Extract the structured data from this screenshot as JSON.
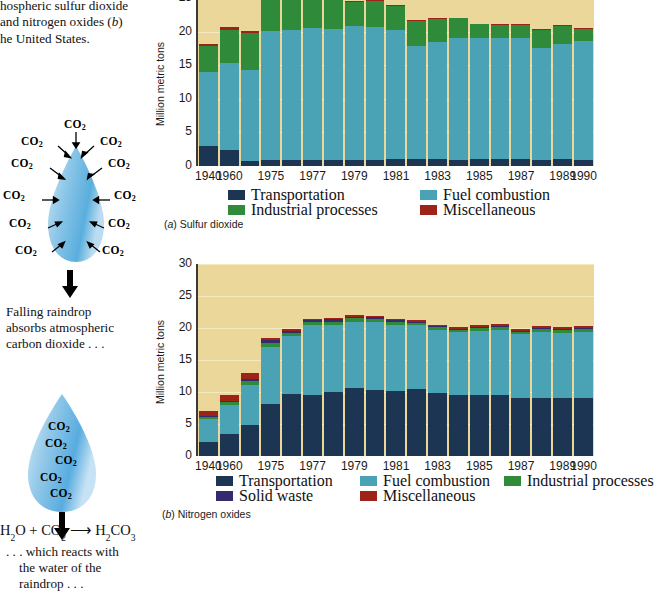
{
  "caption": {
    "line1": "hospheric sulfur dioxide",
    "line2_a": "and nitrogen oxides (",
    "line2_b": "b",
    "line2_c": ")",
    "line3": "he United States."
  },
  "diagram": {
    "co2_label": "CO",
    "co2_sub": "2",
    "note1_line1": "Falling raindrop",
    "note1_line2": "absorbs atmospheric",
    "note1_line3": "carbon dioxide . . .",
    "note2_line1": ". . . which reacts with",
    "note2_line2": "the water of the",
    "note2_line3": "raindrop . . .",
    "equation": "H2O + CO2  →  H2CO3",
    "arrow_icon": "down-arrow-icon",
    "drop_icon": "raindrop-icon"
  },
  "colors": {
    "plot_background": "#ecd79a",
    "transportation": "#1b3553",
    "fuel_combustion": "#4aa3b5",
    "industrial_processes": "#2f8b39",
    "solid_waste": "#352a6e",
    "miscellaneous": "#9d2319",
    "gridline": "#f6ecc8",
    "axis": "#3a3a3a"
  },
  "chart_data": [
    {
      "id": "a",
      "type": "bar",
      "stacked": true,
      "title": "",
      "figure_note_prefix": "(",
      "figure_note_letter": "a",
      "figure_note_suffix": ") Sulfur dioxide",
      "xlabel": "",
      "ylabel": "Million metric tons",
      "ylim": [
        0,
        25
      ],
      "yticks": [
        0,
        5,
        10,
        15,
        20,
        25
      ],
      "ytick_labels": [
        "0",
        "5",
        "10",
        "15",
        "20",
        "25"
      ],
      "grid": true,
      "legend_position": "below",
      "categories": [
        1940,
        1960,
        1974,
        1975,
        1976,
        1977,
        1978,
        1979,
        1980,
        1981,
        1982,
        1983,
        1984,
        1985,
        1986,
        1987,
        1988,
        1989,
        1990
      ],
      "tick_labels": [
        "1940",
        "1960",
        "",
        "1975",
        "",
        "1977",
        "",
        "1979",
        "",
        "1981",
        "",
        "1983",
        "",
        "1985",
        "",
        "1987",
        "",
        "1989",
        "1990"
      ],
      "series": [
        {
          "name": "Transportation",
          "color": "#1b3553",
          "values": [
            3.0,
            2.4,
            0.8,
            0.9,
            0.9,
            0.9,
            0.9,
            0.9,
            0.9,
            1.1,
            1.1,
            1.0,
            0.9,
            1.1,
            1.1,
            1.1,
            0.9,
            1.0,
            0.9
          ]
        },
        {
          "name": "Fuel combustion",
          "color": "#4aa3b5",
          "values": [
            11.0,
            13.0,
            13.5,
            21.0,
            20.1,
            20.7,
            21.4,
            19.9,
            19.8,
            19.2,
            16.8,
            17.5,
            18.1,
            17.9,
            17.9,
            17.9,
            16.6,
            17.1,
            17.7
          ]
        },
        {
          "name": "Industrial processes",
          "color": "#2f8b39",
          "values": [
            3.8,
            4.9,
            5.5,
            5.2,
            4.8,
            4.5,
            5.0,
            3.6,
            3.9,
            3.5,
            3.7,
            3.4,
            3.0,
            2.1,
            2.0,
            2.0,
            2.8,
            2.8,
            1.8
          ]
        },
        {
          "name": "Miscellaneous",
          "color": "#9d2319",
          "values": [
            0.4,
            0.4,
            0.3,
            0.1,
            0.1,
            0.1,
            0.1,
            0.1,
            0.1,
            0.1,
            0.1,
            0.1,
            0.1,
            0.1,
            0.1,
            0.1,
            0.1,
            0.1,
            0.1
          ]
        }
      ],
      "legend": [
        {
          "label": "Transportation",
          "color": "#1b3553"
        },
        {
          "label": "Fuel combustion",
          "color": "#4aa3b5"
        },
        {
          "label": "Industrial processes",
          "color": "#2f8b39"
        },
        {
          "label": "Miscellaneous",
          "color": "#9d2319"
        }
      ]
    },
    {
      "id": "b",
      "type": "bar",
      "stacked": true,
      "title": "",
      "figure_note_prefix": "(",
      "figure_note_letter": "b",
      "figure_note_suffix": ") Nitrogen oxides",
      "xlabel": "",
      "ylabel": "Million metric tons",
      "ylim": [
        0,
        30
      ],
      "yticks": [
        0,
        5,
        10,
        15,
        20,
        25,
        30
      ],
      "ytick_labels": [
        "0",
        "5",
        "10",
        "15",
        "20",
        "25",
        "30"
      ],
      "grid": true,
      "legend_position": "below",
      "categories": [
        1940,
        1960,
        1974,
        1975,
        1976,
        1977,
        1978,
        1979,
        1980,
        1981,
        1982,
        1983,
        1984,
        1985,
        1986,
        1987,
        1988,
        1989,
        1990
      ],
      "tick_labels": [
        "1940",
        "1960",
        "",
        "1975",
        "",
        "1977",
        "",
        "1979",
        "",
        "1981",
        "",
        "1983",
        "",
        "1985",
        "",
        "1987",
        "",
        "1989",
        "1990"
      ],
      "series": [
        {
          "name": "Transportation",
          "color": "#1b3553",
          "values": [
            2.2,
            3.5,
            4.9,
            8.2,
            9.7,
            9.6,
            10.0,
            10.6,
            10.3,
            10.2,
            10.4,
            9.8,
            9.5,
            9.5,
            9.5,
            9.0,
            9.1,
            9.0,
            9.0,
            7.8
          ]
        },
        {
          "name": "Fuel combustion",
          "color": "#4aa3b5",
          "values": [
            3.6,
            4.5,
            6.2,
            8.8,
            9.0,
            10.8,
            10.5,
            10.4,
            10.6,
            10.2,
            10.0,
            9.9,
            9.8,
            10.1,
            10.2,
            10.0,
            10.3,
            10.3,
            10.4,
            10.9
          ]
        },
        {
          "name": "Industrial processes",
          "color": "#2f8b39",
          "values": [
            0.3,
            0.4,
            0.6,
            0.6,
            0.6,
            0.5,
            0.5,
            0.5,
            0.5,
            0.5,
            0.4,
            0.4,
            0.4,
            0.4,
            0.4,
            0.4,
            0.4,
            0.4,
            0.4,
            0.4
          ]
        },
        {
          "name": "Solid waste",
          "color": "#352a6e",
          "values": [
            0.1,
            0.2,
            0.4,
            0.5,
            0.3,
            0.3,
            0.4,
            0.3,
            0.3,
            0.3,
            0.2,
            0.2,
            0.2,
            0.2,
            0.2,
            0.2,
            0.2,
            0.2,
            0.2,
            0.2
          ]
        },
        {
          "name": "Miscellaneous",
          "color": "#9d2319",
          "values": [
            0.9,
            0.9,
            0.9,
            0.3,
            0.2,
            0.2,
            0.2,
            0.2,
            0.2,
            0.2,
            0.2,
            0.2,
            0.3,
            0.3,
            0.3,
            0.3,
            0.3,
            0.3,
            0.3,
            0.3
          ]
        }
      ],
      "legend": [
        {
          "label": "Transportation",
          "color": "#1b3553"
        },
        {
          "label": "Fuel combustion",
          "color": "#4aa3b5"
        },
        {
          "label": "Industrial processes",
          "color": "#2f8b39"
        },
        {
          "label": "Solid waste",
          "color": "#352a6e"
        },
        {
          "label": "Miscellaneous",
          "color": "#9d2319"
        }
      ]
    }
  ]
}
